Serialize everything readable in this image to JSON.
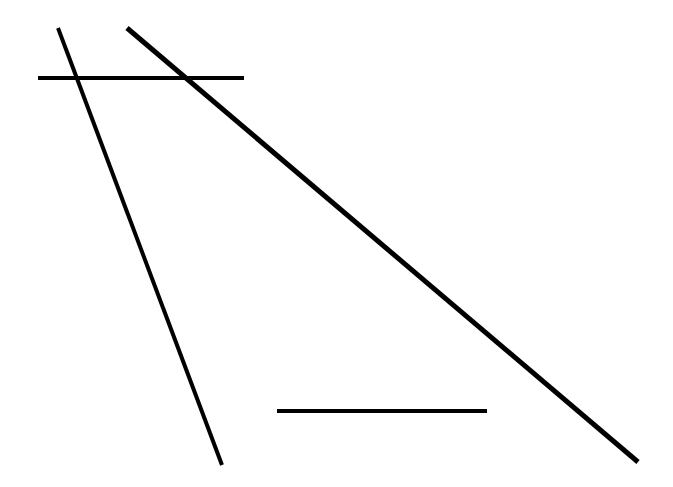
{
  "figure": {
    "background_color": "#ffffff",
    "width": 673,
    "height": 487
  },
  "chart_data": {
    "type": "line",
    "title": "",
    "subtitle": "",
    "xlabel": "",
    "ylabel": "",
    "xlim": [
      0,
      673
    ],
    "ylim": [
      0,
      487
    ],
    "grid": false,
    "legend": null,
    "axes_visible": false,
    "tick_labels_x": [],
    "tick_labels_y": [],
    "annotations": [],
    "series": [
      {
        "name": "segment-steep-diagonal",
        "label": "steep descending diagonal",
        "color": "#000000",
        "stroke_width": 4,
        "x": [
          58,
          222
        ],
        "y": [
          28,
          465
        ],
        "points": [
          {
            "x": 58,
            "y": 28
          },
          {
            "x": 222,
            "y": 465
          }
        ],
        "slope": -2.665,
        "length": 466.8,
        "orientation": "steep-descending"
      },
      {
        "name": "segment-long-diagonal",
        "label": "long shallow descending diagonal",
        "color": "#000000",
        "stroke_width": 5,
        "x": [
          127,
          638
        ],
        "y": [
          28,
          462
        ],
        "points": [
          {
            "x": 127,
            "y": 28
          },
          {
            "x": 638,
            "y": 462
          }
        ],
        "slope": -0.849,
        "length": 670.4,
        "orientation": "shallow-descending"
      },
      {
        "name": "segment-upper-horizontal",
        "label": "upper horizontal line",
        "color": "#000000",
        "stroke_width": 4,
        "x": [
          38,
          244
        ],
        "y": [
          78,
          78
        ],
        "points": [
          {
            "x": 38,
            "y": 78
          },
          {
            "x": 244,
            "y": 78
          }
        ],
        "slope": 0,
        "length": 206,
        "orientation": "horizontal"
      },
      {
        "name": "segment-lower-horizontal",
        "label": "lower horizontal line",
        "color": "#000000",
        "stroke_width": 4,
        "x": [
          277,
          487
        ],
        "y": [
          411,
          411
        ],
        "points": [
          {
            "x": 277,
            "y": 411
          },
          {
            "x": 487,
            "y": 411
          }
        ],
        "slope": 0,
        "length": 210,
        "orientation": "horizontal"
      }
    ],
    "intersections": [
      {
        "name": "steep-x-upper-horizontal",
        "x": 77,
        "y": 78
      },
      {
        "name": "long-x-upper-horizontal",
        "x": 186,
        "y": 78
      }
    ]
  }
}
